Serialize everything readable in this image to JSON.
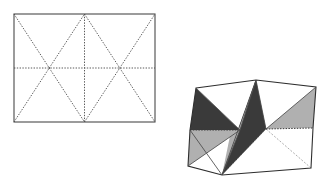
{
  "figure": {
    "background_color": "#ffffff",
    "panels": [
      {
        "id": "crease-pattern",
        "label": "Crease pattern rectangle",
        "type": "crease-pattern",
        "description": "Rectangle divided into two squares by a vertical crease, each square crossed by both diagonals, plus a full-width horizontal midline crease",
        "outline_color": "#4a4a4a",
        "crease_color": "#5a5a5a",
        "geometry": {
          "x": 14,
          "y": 14,
          "width": 141,
          "height": 108,
          "mid_x": 84.5,
          "mid_y": 68,
          "quarter_x": 49.25,
          "three_quarter_x": 119.75
        },
        "creases": [
          {
            "name": "vertical-center-crease",
            "style": "dotted",
            "from": [
              84.5,
              14
            ],
            "to": [
              84.5,
              122
            ]
          },
          {
            "name": "horizontal-mid-crease",
            "style": "dotted",
            "from": [
              14,
              68
            ],
            "to": [
              155,
              68
            ]
          },
          {
            "name": "left-square-diagonal-down",
            "style": "dotted",
            "from": [
              14,
              14
            ],
            "to": [
              84.5,
              122
            ]
          },
          {
            "name": "left-square-diagonal-up",
            "style": "dotted",
            "from": [
              14,
              122
            ],
            "to": [
              84.5,
              14
            ]
          },
          {
            "name": "right-square-diagonal-down",
            "style": "dotted",
            "from": [
              84.5,
              14
            ],
            "to": [
              155,
              122
            ]
          },
          {
            "name": "right-square-diagonal-up",
            "style": "dotted",
            "from": [
              84.5,
              122
            ],
            "to": [
              155,
              14
            ]
          }
        ]
      },
      {
        "id": "folded-form",
        "label": "Folded three-dimensional form",
        "type": "folded-model",
        "description": "Symmetric folded model with dark and light shaded triangular facets meeting at a top apex and bottom apex",
        "colors": {
          "dark_facet": "#3a3a3a",
          "light_facet": "#b0b0b0",
          "white_facet": "#ffffff",
          "edge": "#2e2e2e",
          "hidden_edge": "#8a8a8a"
        },
        "vertices": {
          "top_apex": [
            256,
            80
          ],
          "top_left_shoulder": [
            196,
            88
          ],
          "top_right_shoulder": [
            316,
            87
          ],
          "waist_left": [
            190,
            130
          ],
          "waist_left_inner": [
            240,
            130
          ],
          "waist_right_inner": [
            266,
            129
          ],
          "waist_right": [
            313,
            128
          ],
          "bottom_apex": [
            222,
            175
          ],
          "bottom_left": [
            188,
            166
          ],
          "bottom_right": [
            311,
            168
          ],
          "mid_left_notch": [
            238,
            130
          ],
          "upper_center": [
            256,
            80
          ]
        },
        "facets": [
          {
            "name": "upper-left-dark-triangle",
            "shade": "dark"
          },
          {
            "name": "upper-left-white-triangle",
            "shade": "white"
          },
          {
            "name": "upper-center-light-triangle",
            "shade": "light"
          },
          {
            "name": "upper-center-dark-triangle",
            "shade": "dark"
          },
          {
            "name": "upper-right-white-triangle",
            "shade": "white"
          },
          {
            "name": "upper-right-light-triangle",
            "shade": "light"
          },
          {
            "name": "lower-left-light-triangle",
            "shade": "light"
          },
          {
            "name": "lower-left-white-triangle",
            "shade": "white"
          },
          {
            "name": "lower-center-light-triangle",
            "shade": "light"
          },
          {
            "name": "lower-center-dark-triangle",
            "shade": "dark"
          },
          {
            "name": "lower-right-white-triangle",
            "shade": "white"
          }
        ],
        "hidden_edges": [
          {
            "name": "hidden-diagonal-to-bottom-right",
            "from": [
              266,
              129
            ],
            "to": [
              311,
              168
            ]
          },
          {
            "name": "hidden-diagonal-to-bottom-apex",
            "from": [
              266,
              129
            ],
            "to": [
              222,
              175
            ]
          }
        ]
      }
    ]
  }
}
